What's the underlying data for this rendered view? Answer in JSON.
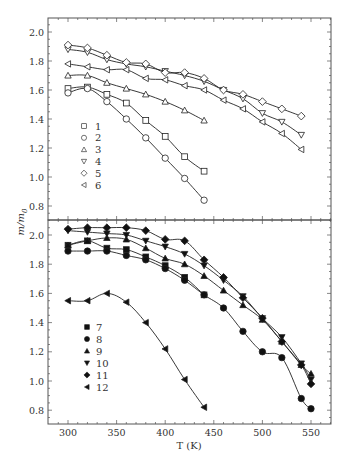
{
  "chart_data": [
    {
      "type": "line",
      "panel": "upper",
      "title": "",
      "xlabel": "T (K)",
      "ylabel": "m/m0",
      "xlim": [
        280,
        570
      ],
      "ylim": [
        0.7,
        2.1
      ],
      "yticks": [
        0.8,
        1.0,
        1.2,
        1.4,
        1.6,
        1.8,
        2.0
      ],
      "ytick_labels": [
        "0.8",
        "1.0",
        "1.2",
        "1.4",
        "1.6",
        "1.8",
        "2.0"
      ],
      "grid": false,
      "legend_position": "left-center",
      "series": [
        {
          "name": "1",
          "marker": "square-open",
          "x": [
            300,
            320,
            340,
            360,
            380,
            400,
            420,
            440
          ],
          "values": [
            1.61,
            1.62,
            1.57,
            1.51,
            1.39,
            1.28,
            1.14,
            1.04
          ]
        },
        {
          "name": "2",
          "marker": "circle-open",
          "x": [
            300,
            320,
            340,
            360,
            380,
            400,
            420,
            440
          ],
          "values": [
            1.58,
            1.61,
            1.52,
            1.4,
            1.27,
            1.13,
            0.99,
            0.84
          ]
        },
        {
          "name": "3",
          "marker": "triangle-up-open",
          "x": [
            300,
            320,
            340,
            360,
            380,
            400,
            420,
            440
          ],
          "values": [
            1.7,
            1.7,
            1.65,
            1.61,
            1.57,
            1.52,
            1.46,
            1.39
          ]
        },
        {
          "name": "4",
          "marker": "triangle-down-open",
          "x": [
            300,
            320,
            340,
            360,
            380,
            400,
            420,
            440,
            460,
            480,
            500,
            520,
            540
          ],
          "values": [
            1.88,
            1.86,
            1.81,
            1.78,
            1.76,
            1.73,
            1.7,
            1.66,
            1.6,
            1.54,
            1.44,
            1.38,
            1.29
          ]
        },
        {
          "name": "5",
          "marker": "diamond-open",
          "x": [
            300,
            320,
            340,
            360,
            380,
            400,
            420,
            440,
            460,
            480,
            500,
            520,
            540
          ],
          "values": [
            1.91,
            1.89,
            1.84,
            1.79,
            1.78,
            1.72,
            1.72,
            1.68,
            1.6,
            1.57,
            1.52,
            1.47,
            1.42
          ]
        },
        {
          "name": "6",
          "marker": "triangle-left-open",
          "x": [
            300,
            320,
            340,
            360,
            380,
            400,
            420,
            440,
            460,
            480,
            500,
            520,
            540
          ],
          "values": [
            1.78,
            1.76,
            1.74,
            1.74,
            1.68,
            1.67,
            1.63,
            1.6,
            1.53,
            1.47,
            1.38,
            1.3,
            1.19
          ]
        }
      ]
    },
    {
      "type": "line",
      "panel": "lower",
      "title": "",
      "xlabel": "T (K)",
      "ylabel": "m/m0",
      "xlim": [
        280,
        570
      ],
      "ylim": [
        0.7,
        2.1
      ],
      "xticks": [
        300,
        350,
        400,
        450,
        500,
        550
      ],
      "xtick_labels": [
        "300",
        "350",
        "400",
        "450",
        "500",
        "550"
      ],
      "yticks": [
        0.8,
        1.0,
        1.2,
        1.4,
        1.6,
        1.8,
        2.0
      ],
      "ytick_labels": [
        "0.8",
        "1.0",
        "1.2",
        "1.4",
        "1.6",
        "1.8",
        "2.0"
      ],
      "grid": false,
      "legend_position": "left-center",
      "series": [
        {
          "name": "7",
          "marker": "square-filled",
          "x": [
            300,
            320,
            340,
            360,
            380,
            400,
            420,
            440
          ],
          "values": [
            1.93,
            1.96,
            1.91,
            1.9,
            1.85,
            1.79,
            1.71,
            1.59
          ]
        },
        {
          "name": "8",
          "marker": "circle-filled",
          "x": [
            300,
            320,
            340,
            360,
            380,
            400,
            420,
            440,
            460,
            480,
            500,
            520,
            540,
            550
          ],
          "values": [
            1.89,
            1.89,
            1.89,
            1.86,
            1.83,
            1.77,
            1.69,
            1.59,
            1.5,
            1.34,
            1.2,
            1.16,
            0.88,
            0.81
          ]
        },
        {
          "name": "9",
          "marker": "triangle-up-filled",
          "x": [
            300,
            320,
            340,
            360,
            380,
            400,
            420,
            440,
            460,
            480,
            500,
            520,
            540,
            550
          ],
          "values": [
            1.93,
            1.96,
            1.98,
            1.97,
            1.91,
            1.84,
            1.8,
            1.72,
            1.62,
            1.52,
            1.42,
            1.27,
            1.11,
            1.05
          ]
        },
        {
          "name": "10",
          "marker": "triangle-down-filled",
          "x": [
            300,
            320,
            340,
            360,
            380,
            400,
            420,
            440,
            460,
            480,
            500,
            520,
            540,
            550
          ],
          "values": [
            2.03,
            2.02,
            2.01,
            2.0,
            1.96,
            1.92,
            1.87,
            1.79,
            1.69,
            1.58,
            1.43,
            1.3,
            1.12,
            1.01
          ]
        },
        {
          "name": "11",
          "marker": "diamond-filled",
          "x": [
            300,
            320,
            340,
            360,
            380,
            400,
            420,
            440,
            460,
            480,
            500,
            520,
            540,
            550
          ],
          "values": [
            2.04,
            2.05,
            2.05,
            2.05,
            2.03,
            1.97,
            1.96,
            1.83,
            1.71,
            1.57,
            1.43,
            1.27,
            1.11,
            0.98
          ]
        },
        {
          "name": "12",
          "marker": "triangle-left-filled",
          "x": [
            300,
            320,
            340,
            360,
            380,
            400,
            420,
            440
          ],
          "values": [
            1.55,
            1.55,
            1.6,
            1.54,
            1.4,
            1.22,
            1.01,
            0.82
          ]
        }
      ]
    }
  ],
  "labels": {
    "x_axis": "T (K)",
    "y_axis_main": "m/m",
    "y_axis_sub": "0"
  }
}
